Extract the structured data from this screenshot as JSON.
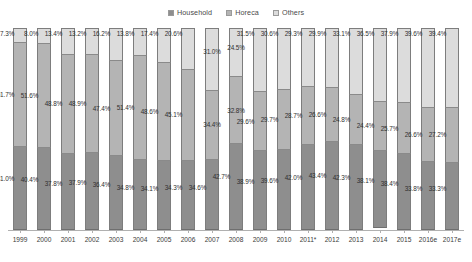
{
  "legend": {
    "position": "top-center",
    "items": [
      {
        "label": "Household",
        "icon": "legend-swatch-icon",
        "color": "#8e8e8e"
      },
      {
        "label": "Horeca",
        "icon": "legend-swatch-icon",
        "color": "#b4b4b4"
      },
      {
        "label": "Others",
        "icon": "legend-swatch-icon",
        "color": "#dcdcdc"
      }
    ]
  },
  "chart_data": {
    "type": "bar",
    "subtype": "stacked-100-percent",
    "title": "",
    "subtitle": "",
    "xlabel": "",
    "ylabel": "",
    "ylim": [
      0,
      100
    ],
    "grid": false,
    "orientation": "vertical",
    "categories": [
      "1999",
      "2000",
      "2001",
      "2002",
      "2003",
      "2004",
      "2005",
      "2006",
      "2007",
      "2008",
      "2009",
      "2010",
      "2011*",
      "2012",
      "2013",
      "2014",
      "2015",
      "2016e",
      "2017e"
    ],
    "series": [
      {
        "name": "Household",
        "color": "#8e8e8e",
        "values": [
          41.0,
          40.4,
          37.8,
          37.9,
          36.4,
          34.8,
          34.1,
          34.3,
          34.6,
          42.7,
          38.9,
          39.6,
          42.0,
          43.4,
          42.3,
          38.1,
          38.4,
          33.8,
          33.3
        ],
        "labels": [
          "41.0%",
          "40.4%",
          "37.8%",
          "37.9%",
          "36.4%",
          "34.8%",
          "34.1%",
          "34.3%",
          "34.6%",
          "42.7%",
          "38.9%",
          "39.6%",
          "42.0%",
          "43.4%",
          "42.3%",
          "38.1%",
          "38.4%",
          "33.8%",
          "33.3%"
        ]
      },
      {
        "name": "Horeca",
        "color": "#b4b4b4",
        "values": [
          51.7,
          51.6,
          48.8,
          48.9,
          47.4,
          51.4,
          48.6,
          45.1,
          34.4,
          32.8,
          29.6,
          29.7,
          28.7,
          26.6,
          24.8,
          24.4,
          25.7,
          26.6,
          27.2
        ],
        "labels": [
          "51.7%",
          "51.6%",
          "48.8%",
          "48.9%",
          "47.4%",
          "51.4%",
          "48.6%",
          "45.1%",
          "34.4%",
          "32.8%",
          "29.6%",
          "29.7%",
          "28.7%",
          "26.6%",
          "24.8%",
          "24.4%",
          "25.7%",
          "26.6%",
          "27.2%"
        ]
      },
      {
        "name": "Others",
        "color": "#dcdcdc",
        "values": [
          7.3,
          8.0,
          13.4,
          13.2,
          16.2,
          13.8,
          17.4,
          20.6,
          31.0,
          24.5,
          31.5,
          30.6,
          29.3,
          29.9,
          33.1,
          36.5,
          37.9,
          39.6,
          39.4
        ],
        "labels": [
          "7.3%",
          "8.0%",
          "13.4%",
          "13.2%",
          "16.2%",
          "13.8%",
          "17.4%",
          "20.6%",
          "31.0%",
          "24.5%",
          "31.5%",
          "30.6%",
          "29.3%",
          "29.9%",
          "33.1%",
          "36.5%",
          "37.9%",
          "39.6%",
          "39.4%"
        ]
      }
    ]
  }
}
